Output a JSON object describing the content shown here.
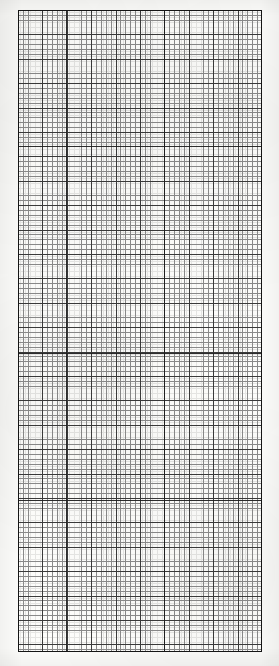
{
  "document": {
    "kind": "graph-paper-scan",
    "title": "Graph paper grid sheet",
    "caption": "",
    "paper_color": "#fdfdfb",
    "ink_color": "#262626",
    "page": {
      "width_px": 279,
      "height_px": 666
    }
  },
  "grid": {
    "region": {
      "left_px": 18,
      "top_px": 10,
      "width_px": 244,
      "height_px": 642
    },
    "minor_cell_px": 4.88,
    "sub_cell_px": 2.44,
    "major_every_n_cells": 5,
    "major_cell_px": 24.4,
    "columns_minor": 50,
    "rows_minor": 132,
    "columns_major": 10,
    "rows_major": 26,
    "minor_line_color": "#8a8a8a",
    "sub_line_color": "#c2c2c2",
    "major_line_color": "#3a3a3a",
    "border_color": "#151515",
    "minor_line_width_px": 0.8,
    "major_line_width_px": 1.1,
    "border_width_px": 1,
    "emphasis_rows_px": [
      146,
      353,
      500
    ],
    "emphasis_cols_px": [
      66,
      164
    ]
  },
  "chart_data": {
    "type": "table",
    "title": "Graph paper grid sheet",
    "xlabel": "",
    "ylabel": "",
    "grid": true,
    "legend": "none",
    "categories": [],
    "values": []
  }
}
